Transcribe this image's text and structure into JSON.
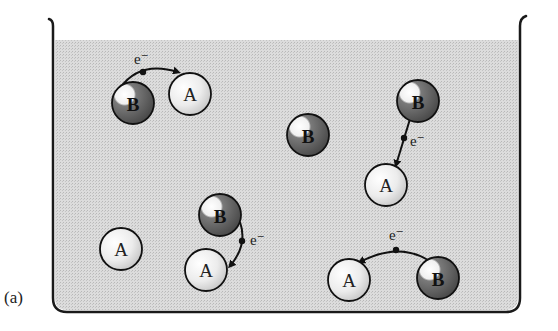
{
  "figure": {
    "panel_label": "(a)",
    "electron_label": "e⁻",
    "colors": {
      "liquid": "#d4d4d4",
      "beaker_outline": "#1a1a1a",
      "particle_A_fill": "#e6e6e6",
      "particle_B_fill": "#6e6e6e",
      "arrow": "#111111"
    },
    "particles": [
      {
        "id": "pair1-B",
        "label": "B",
        "species": "B",
        "cx": 133,
        "cy": 103
      },
      {
        "id": "pair1-A",
        "label": "A",
        "species": "A",
        "cx": 190,
        "cy": 94
      },
      {
        "id": "lone-B",
        "label": "B",
        "species": "B",
        "cx": 308,
        "cy": 135
      },
      {
        "id": "pair2-B",
        "label": "B",
        "species": "B",
        "cx": 418,
        "cy": 101
      },
      {
        "id": "pair2-A",
        "label": "A",
        "species": "A",
        "cx": 386,
        "cy": 185
      },
      {
        "id": "pair3-B",
        "label": "B",
        "species": "B",
        "cx": 220,
        "cy": 215
      },
      {
        "id": "pair3-A",
        "label": "A",
        "species": "A",
        "cx": 206,
        "cy": 270
      },
      {
        "id": "lone-A",
        "label": "A",
        "species": "A",
        "cx": 121,
        "cy": 249
      },
      {
        "id": "pair4-A",
        "label": "A",
        "species": "A",
        "cx": 349,
        "cy": 280
      },
      {
        "id": "pair4-B",
        "label": "B",
        "species": "B",
        "cx": 438,
        "cy": 278
      }
    ],
    "transfers": [
      {
        "from": "B",
        "to": "A",
        "label": "e⁻"
      },
      {
        "from": "B",
        "to": "A",
        "label": "e⁻"
      },
      {
        "from": "B",
        "to": "A",
        "label": "e⁻"
      },
      {
        "from": "B",
        "to": "A",
        "label": "e⁻"
      }
    ]
  }
}
